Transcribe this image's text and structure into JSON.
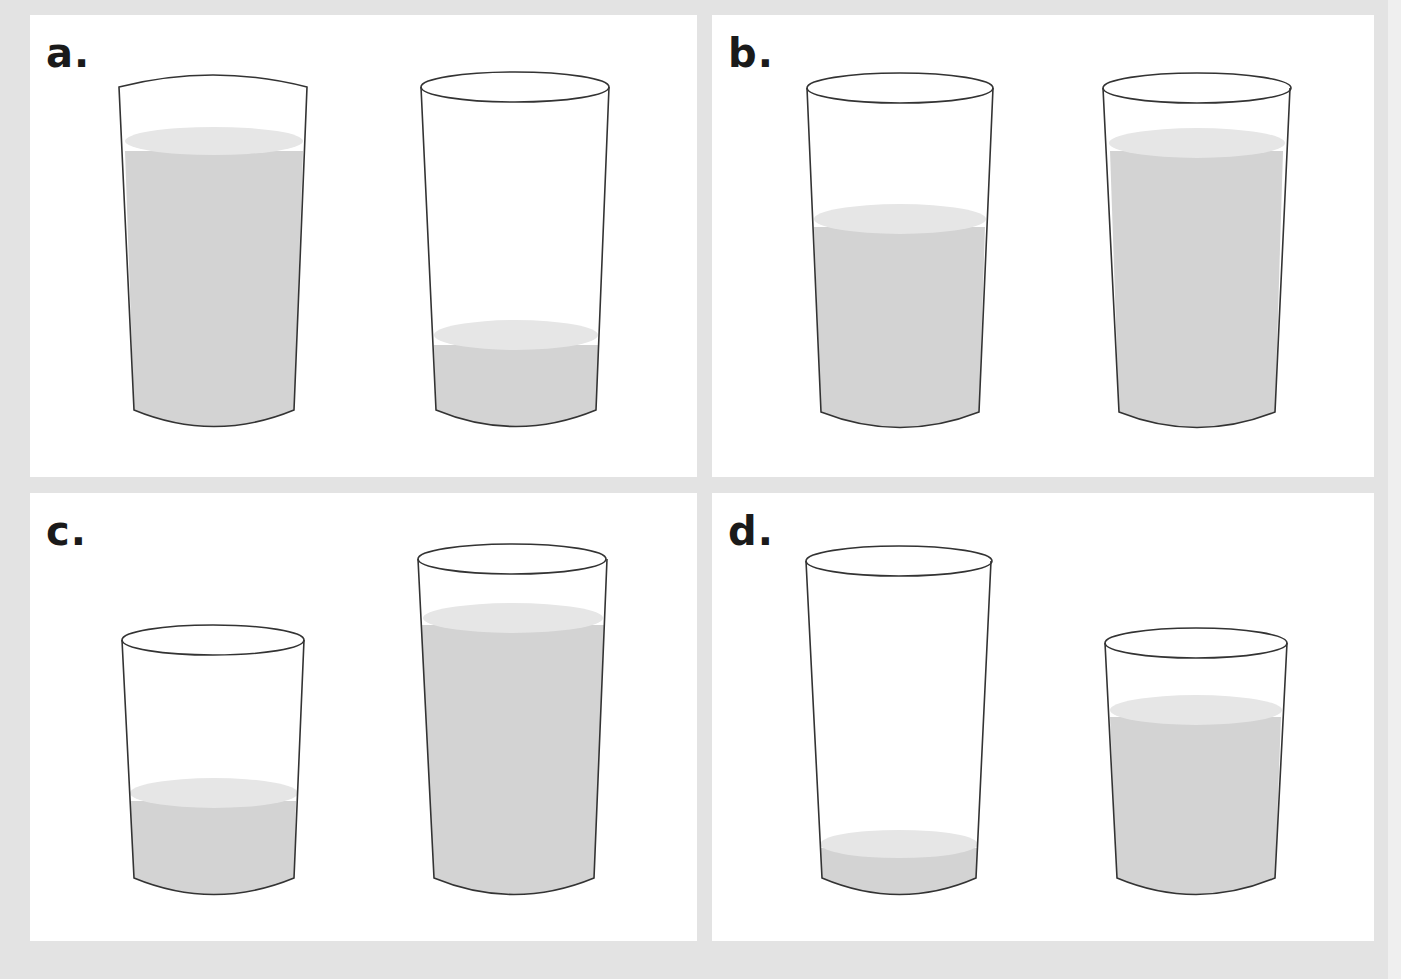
{
  "figure": {
    "colors": {
      "background": "#e3e3e3",
      "panel": "#ffffff",
      "outline": "#333333",
      "liquid": "#d3d3d3",
      "liquid_surface": "#e6e6e6"
    },
    "panels": [
      {
        "id": "a",
        "label": "a.",
        "glasses": [
          {
            "position": "left",
            "fill": "mostly full",
            "fill_fraction": 0.85
          },
          {
            "position": "right",
            "fill": "low",
            "fill_fraction": 0.25
          }
        ]
      },
      {
        "id": "b",
        "label": "b.",
        "glasses": [
          {
            "position": "left",
            "fill": "about half",
            "fill_fraction": 0.6
          },
          {
            "position": "right",
            "fill": "mostly full",
            "fill_fraction": 0.85
          }
        ]
      },
      {
        "id": "c",
        "label": "c.",
        "glasses": [
          {
            "position": "left",
            "size": "short",
            "fill": "low",
            "fill_fraction": 0.35
          },
          {
            "position": "right",
            "size": "tall",
            "fill": "nearly full",
            "fill_fraction": 0.9
          }
        ]
      },
      {
        "id": "d",
        "label": "d.",
        "glasses": [
          {
            "position": "left",
            "size": "tall",
            "fill": "very low",
            "fill_fraction": 0.1
          },
          {
            "position": "right",
            "size": "short",
            "fill": "mostly full",
            "fill_fraction": 0.75
          }
        ]
      }
    ]
  }
}
